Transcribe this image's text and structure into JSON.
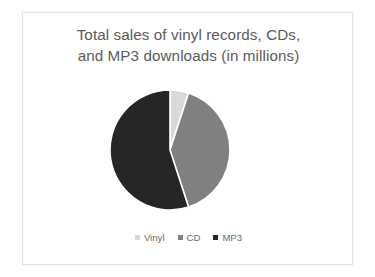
{
  "slide": {
    "background_color": "#ffffff",
    "border_color": "#e3e3e3"
  },
  "chart_data": {
    "type": "pie",
    "title": "Total sales of vinyl records, CDs, and MP3 downloads (in millions)",
    "title_lines": [
      "Total sales of vinyl records, CDs,",
      "and MP3 downloads (in millions)"
    ],
    "title_color": "#5b5b5b",
    "categories": [
      "Vinyl",
      "CD",
      "MP3"
    ],
    "values": [
      5,
      40,
      55
    ],
    "unit": "millions",
    "percentages": [
      5,
      40,
      55
    ],
    "colors": [
      "#d9d9d9",
      "#808080",
      "#262626"
    ],
    "start_angle_deg": 0,
    "direction": "clockwise",
    "slice_separator_color": "#ffffff",
    "legend_position": "bottom",
    "legend_entries": [
      {
        "label": "Vinyl",
        "color": "#d9d9d9"
      },
      {
        "label": "CD",
        "color": "#808080"
      },
      {
        "label": "MP3",
        "color": "#262626"
      }
    ],
    "xlabel": "",
    "ylabel": "",
    "grid": false,
    "data_labels_shown": false
  }
}
